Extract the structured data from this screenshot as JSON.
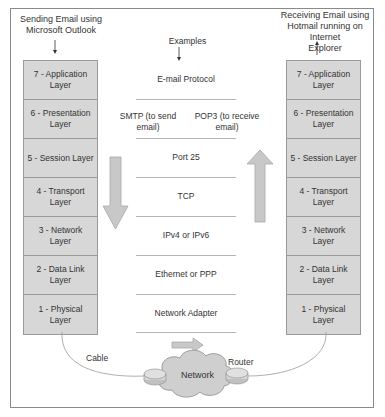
{
  "sender": {
    "title_line1": "Sending Email using",
    "title_line2": "Microsoft Outlook"
  },
  "receiver": {
    "title_line1": "Receiving Email using",
    "title_line2": "Hotmail running on Internet",
    "title_line3": "Explorer"
  },
  "layers": [
    {
      "line1": "7 - Application",
      "line2": "Layer"
    },
    {
      "line1": "6 - Presentation",
      "line2": "Layer"
    },
    {
      "line1": "5 - Session Layer",
      "line2": ""
    },
    {
      "line1": "4 - Transport Layer",
      "line2": ""
    },
    {
      "line1": "3 - Network Layer",
      "line2": ""
    },
    {
      "line1": "2 - Data Link Layer",
      "line2": ""
    },
    {
      "line1": "1 - Physical Layer",
      "line2": ""
    }
  ],
  "examples": {
    "heading": "Examples",
    "rows": [
      "E-mail Protocol",
      "",
      "Port 25",
      "TCP",
      "IPv4 or IPv6",
      "Ethernet or PPP",
      "Network Adapter"
    ],
    "smtp_line1": "SMTP (to send",
    "smtp_line2": "email)",
    "pop3_line1": "POP3 (to receive",
    "pop3_line2": "email)"
  },
  "network": {
    "cable_label": "Cable",
    "router_label": "Router",
    "cloud_label": "Network"
  },
  "colors": {
    "layer_fill": "#d7d7d7",
    "arrow_fill": "#c8c8c8",
    "border": "#8a8a8a"
  }
}
